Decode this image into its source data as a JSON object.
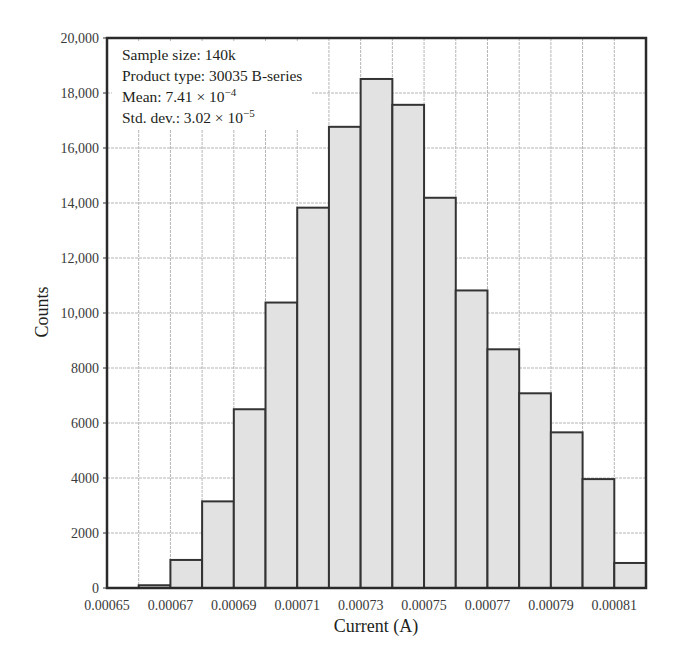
{
  "chart_data": {
    "type": "bar",
    "subtype": "histogram",
    "title": "",
    "xlabel": "Current (A)",
    "ylabel": "Counts",
    "bin_edges": [
      0.00065,
      0.00066,
      0.00067,
      0.00068,
      0.00069,
      0.0007,
      0.00071,
      0.00072,
      0.00073,
      0.00074,
      0.00075,
      0.00076,
      0.00077,
      0.00078,
      0.00079,
      0.0008,
      0.00081,
      0.00082
    ],
    "categories": [
      "0.00065",
      "0.00066",
      "0.00067",
      "0.00068",
      "0.00069",
      "0.00070",
      "0.00071",
      "0.00072",
      "0.00073",
      "0.00074",
      "0.00075",
      "0.00076",
      "0.00077",
      "0.00078",
      "0.00079",
      "0.00080",
      "0.00081"
    ],
    "values": [
      0,
      100,
      1020,
      3150,
      6500,
      10380,
      13830,
      16770,
      18510,
      17570,
      14190,
      10820,
      8680,
      7080,
      5660,
      3960,
      910
    ],
    "xlim": [
      0.00065,
      0.00082
    ],
    "ylim": [
      0,
      20000
    ],
    "x_ticks": [
      "0.00065",
      "0.00067",
      "0.00069",
      "0.00071",
      "0.00073",
      "0.00075",
      "0.00077",
      "0.00079",
      "0.00081"
    ],
    "y_ticks": [
      "0",
      "2000",
      "4000",
      "6000",
      "8000",
      "10,000",
      "12,000",
      "14,000",
      "16,000",
      "18,000",
      "20,000"
    ],
    "grid": true,
    "bar_color": "#e2e2e2",
    "edge_color": "#333333",
    "annotations": [
      "Sample size: 140k",
      "Product type: 30035 B-series",
      "Mean: 7.41 × 10⁻⁴",
      "Std. dev.: 3.02 × 10⁻⁵"
    ]
  },
  "annotation_box": {
    "sample_size": "Sample size: 140k",
    "product_type": "Product type: 30035 B-series",
    "mean_prefix": "Mean: 7.41 × 10",
    "mean_exp": "−4",
    "std_prefix": "Std. dev.: 3.02 × 10",
    "std_exp": "−5"
  }
}
